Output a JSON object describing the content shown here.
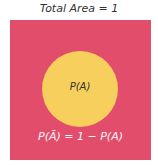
{
  "title": "Total Area = 1",
  "diagram": {
    "sample_space_color": "#e34d6c",
    "event_color": "#f7cf5c",
    "event_label": "P(A)",
    "complement_label": "P(Ā) = 1 − P(A)"
  }
}
